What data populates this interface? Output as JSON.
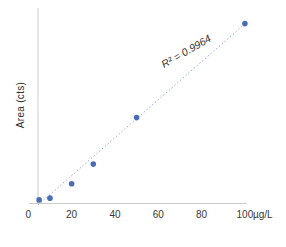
{
  "chart_data": {
    "type": "scatter",
    "title": "",
    "ylabel": "Area (cts)",
    "xlabel_unit": "µg/L",
    "x_ticks": [
      "0",
      "20",
      "40",
      "60",
      "80",
      "100"
    ],
    "x_range": [
      0,
      100
    ],
    "y_axis_tick_labels_visible": false,
    "annotation": "R² = 0.9964",
    "legend": "none",
    "grid": false,
    "series": [
      {
        "name": "calibration-points",
        "x": [
          5,
          10,
          20,
          30,
          50,
          100
        ],
        "y": [
          2,
          3,
          11,
          22,
          48,
          100.5
        ]
      }
    ],
    "trendline": {
      "style": "dotted",
      "slope": 1.06,
      "intercept": -5.6,
      "x_start": 4.5,
      "x_end": 100.9
    },
    "colors": {
      "point": "#4a6db5",
      "trendline": "#8ba3d6",
      "axis": "#cccccc",
      "tick_text": "#383838",
      "label_text": "#2e2e2e",
      "annotation_text": "#333333"
    }
  }
}
